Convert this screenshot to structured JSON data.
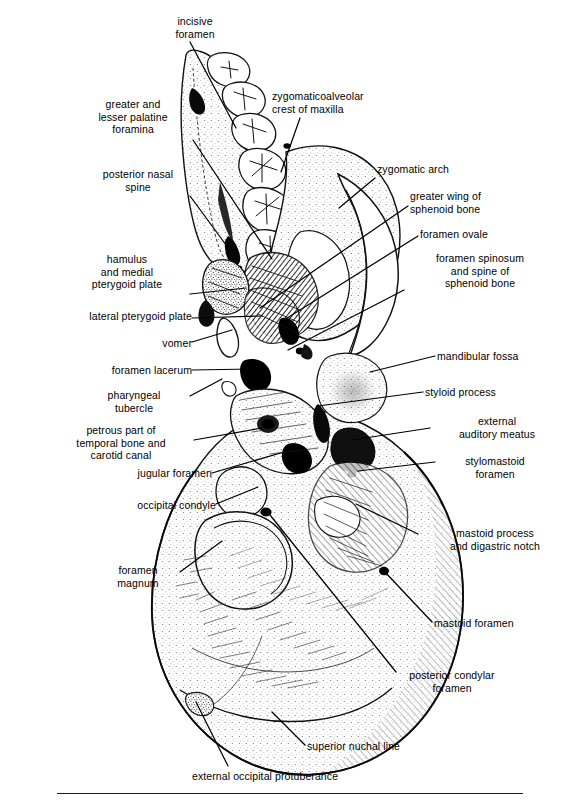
{
  "figure": {
    "view": "inferior (basal) aspect",
    "rule_visible": true,
    "background_color": "#ffffff",
    "ink_color": "#000000",
    "label_font_size_px": 10.5
  },
  "labels": [
    {
      "id": "incisive-foramen",
      "text": "incisive\nforamen",
      "align": "center",
      "x": 152,
      "y": 15,
      "w": 86
    },
    {
      "id": "greater-lesser-palatine",
      "text": "greater and\nlesser palatine\nforamina",
      "align": "center",
      "x": 76,
      "y": 98,
      "w": 114
    },
    {
      "id": "posterior-nasal-spine",
      "text": "posterior nasal\nspine",
      "align": "center",
      "x": 82,
      "y": 168,
      "w": 112
    },
    {
      "id": "hamulus-medial-pterygoid",
      "text": "hamulus\nand medial\npterygoid plate",
      "align": "center",
      "x": 66,
      "y": 253,
      "w": 122
    },
    {
      "id": "lateral-pterygoid-plate",
      "text": "lateral pterygoid plate",
      "align": "right",
      "x": 14,
      "y": 310,
      "w": 178
    },
    {
      "id": "vomer",
      "text": "vomer",
      "align": "right",
      "x": 110,
      "y": 337,
      "w": 82
    },
    {
      "id": "foramen-lacerum",
      "text": "foramen lacerum",
      "align": "right",
      "x": 58,
      "y": 364,
      "w": 134
    },
    {
      "id": "pharyngeal-tubercle",
      "text": "pharyngeal\ntubercle",
      "align": "center",
      "x": 78,
      "y": 389,
      "w": 112
    },
    {
      "id": "petrous-temporal-carotid",
      "text": "petrous part of\ntemporal bone and\ncarotid canal",
      "align": "center",
      "x": 48,
      "y": 424,
      "w": 146
    },
    {
      "id": "jugular-foramen",
      "text": "jugular foramen",
      "align": "right",
      "x": 88,
      "y": 467,
      "w": 124
    },
    {
      "id": "occipital-condyle",
      "text": "occipital condyle",
      "align": "right",
      "x": 84,
      "y": 499,
      "w": 132
    },
    {
      "id": "foramen-magnum",
      "text": "foramen\nmagnum",
      "align": "center",
      "x": 96,
      "y": 564,
      "w": 84
    },
    {
      "id": "zygomaticoalveolar-crest",
      "text": "zygomaticoalveolar\ncrest of maxilla",
      "align": "left",
      "x": 272,
      "y": 90,
      "w": 142
    },
    {
      "id": "zygomatic-arch",
      "text": "zygomatic arch",
      "align": "left",
      "x": 377,
      "y": 163,
      "w": 120
    },
    {
      "id": "greater-wing-sphenoid",
      "text": "greater wing of\nsphenoid bone",
      "align": "left",
      "x": 410,
      "y": 190,
      "w": 122
    },
    {
      "id": "foramen-ovale",
      "text": "foramen ovale",
      "align": "left",
      "x": 420,
      "y": 228,
      "w": 116
    },
    {
      "id": "foramen-spinosum-spine",
      "text": "foramen spinosum\nand spine of\nsphenoid bone",
      "align": "center",
      "x": 407,
      "y": 252,
      "w": 146
    },
    {
      "id": "mandibular-fossa",
      "text": "mandibular fossa",
      "align": "left",
      "x": 437,
      "y": 350,
      "w": 132
    },
    {
      "id": "styloid-process",
      "text": "styloid process",
      "align": "left",
      "x": 425,
      "y": 386,
      "w": 122
    },
    {
      "id": "external-auditory-meatus",
      "text": "external\nauditory meatus",
      "align": "center",
      "x": 433,
      "y": 415,
      "w": 128
    },
    {
      "id": "stylomastoid-foramen",
      "text": "stylomastoid\nforamen",
      "align": "center",
      "x": 437,
      "y": 455,
      "w": 116
    },
    {
      "id": "mastoid-process-digastric",
      "text": "mastoid process\nand digastric notch",
      "align": "center",
      "x": 420,
      "y": 527,
      "w": 150
    },
    {
      "id": "mastoid-foramen",
      "text": "mastoid foramen",
      "align": "left",
      "x": 434,
      "y": 617,
      "w": 132
    },
    {
      "id": "posterior-condylar-foramen",
      "text": "posterior condylar\nforamen",
      "align": "center",
      "x": 385,
      "y": 669,
      "w": 134
    },
    {
      "id": "superior-nuchal-line",
      "text": "superior nuchal line",
      "align": "left",
      "x": 307,
      "y": 740,
      "w": 148
    },
    {
      "id": "external-occipital-protub",
      "text": "external occipital protuberance",
      "align": "left",
      "x": 192,
      "y": 770,
      "w": 226
    }
  ],
  "leader_lines": [
    {
      "id": "ll-incisive-foramen",
      "from": [
        190,
        42
      ],
      "to": [
        236,
        128
      ]
    },
    {
      "id": "ll-palatine-foramina",
      "from": [
        193,
        140
      ],
      "to": [
        272,
        259
      ]
    },
    {
      "id": "ll-posterior-nasal-spine",
      "from": [
        190,
        196
      ],
      "to": [
        232,
        253
      ]
    },
    {
      "id": "ll-hamulus",
      "from": [
        190,
        294
      ],
      "to": [
        246,
        288
      ]
    },
    {
      "id": "ll-lateral-pterygoid-plate",
      "from": [
        192,
        318
      ],
      "to": [
        262,
        316
      ]
    },
    {
      "id": "ll-vomer",
      "from": [
        192,
        342
      ],
      "to": [
        232,
        330
      ]
    },
    {
      "id": "ll-foramen-lacerum",
      "from": [
        192,
        370
      ],
      "to": [
        252,
        369
      ]
    },
    {
      "id": "ll-pharyngeal-tubercle",
      "from": [
        190,
        396
      ],
      "to": [
        222,
        379
      ]
    },
    {
      "id": "ll-petrous-carotid",
      "from": [
        194,
        440
      ],
      "to": [
        262,
        428
      ]
    },
    {
      "id": "ll-jugular-foramen",
      "from": [
        212,
        473
      ],
      "to": [
        284,
        452
      ]
    },
    {
      "id": "ll-occipital-condyle",
      "from": [
        216,
        504
      ],
      "to": [
        258,
        487
      ]
    },
    {
      "id": "ll-foramen-magnum",
      "from": [
        180,
        572
      ],
      "to": [
        222,
        541
      ]
    },
    {
      "id": "ll-zygomaticoalveolar",
      "from": [
        300,
        118
      ],
      "to": [
        281,
        172
      ]
    },
    {
      "id": "ll-zygomatic-arch",
      "from": [
        375,
        178
      ],
      "to": [
        339,
        208
      ]
    },
    {
      "id": "ll-greater-wing",
      "from": [
        408,
        206
      ],
      "to": [
        260,
        308
      ]
    },
    {
      "id": "ll-foramen-ovale",
      "from": [
        418,
        236
      ],
      "to": [
        284,
        320
      ]
    },
    {
      "id": "ll-foramen-spinosum",
      "from": [
        404,
        290
      ],
      "to": [
        288,
        350
      ]
    },
    {
      "id": "ll-mandibular-fossa",
      "from": [
        435,
        356
      ],
      "to": [
        370,
        372
      ]
    },
    {
      "id": "ll-styloid-process",
      "from": [
        423,
        392
      ],
      "to": [
        318,
        406
      ]
    },
    {
      "id": "ll-external-auditory-meatus",
      "from": [
        430,
        428
      ],
      "to": [
        352,
        440
      ]
    },
    {
      "id": "ll-stylomastoid-foramen",
      "from": [
        435,
        462
      ],
      "to": [
        358,
        471
      ]
    },
    {
      "id": "ll-mastoid-process",
      "from": [
        418,
        534
      ],
      "to": [
        356,
        504
      ]
    },
    {
      "id": "ll-mastoid-foramen",
      "from": [
        432,
        622
      ],
      "to": [
        385,
        572
      ]
    },
    {
      "id": "ll-posterior-condylar",
      "from": [
        396,
        672
      ],
      "to": [
        266,
        510
      ]
    },
    {
      "id": "ll-superior-nuchal-line",
      "from": [
        305,
        745
      ],
      "to": [
        272,
        712
      ]
    },
    {
      "id": "ll-external-occipital",
      "from": [
        228,
        766
      ],
      "to": [
        196,
        702
      ]
    }
  ]
}
